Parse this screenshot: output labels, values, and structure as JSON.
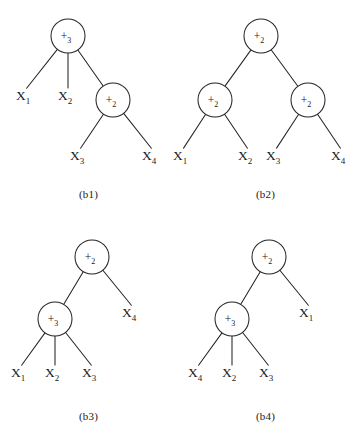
{
  "figure": {
    "type": "expression-tree-diagram",
    "background_color": "#ffffff",
    "stroke_color": "#252525",
    "panel_count": 4
  },
  "panels": [
    {
      "id": "b1",
      "caption": "(b1)",
      "nodes": [
        {
          "id": "n1",
          "op": "+",
          "arity": "3",
          "label": "+3",
          "cx": 68,
          "cy": 36,
          "r": 17
        },
        {
          "id": "n2",
          "op": "+",
          "arity": "2",
          "label": "+2",
          "cx": 113,
          "cy": 100,
          "r": 17
        }
      ],
      "leaves": [
        {
          "id": "l1",
          "var": "X",
          "index": "1",
          "label": "X1",
          "x": 26,
          "y": 100
        },
        {
          "id": "l2",
          "var": "X",
          "index": "2",
          "label": "X2",
          "x": 68,
          "y": 100
        },
        {
          "id": "l3",
          "var": "X",
          "index": "3",
          "label": "X3",
          "x": 80,
          "y": 160
        },
        {
          "id": "l4",
          "var": "X",
          "index": "4",
          "label": "X4",
          "x": 152,
          "y": 160
        }
      ],
      "edges": [
        {
          "from": "n1",
          "to": "l1"
        },
        {
          "from": "n1",
          "to": "l2"
        },
        {
          "from": "n1",
          "to": "n2"
        },
        {
          "from": "n2",
          "to": "l3"
        },
        {
          "from": "n2",
          "to": "l4"
        }
      ]
    },
    {
      "id": "b2",
      "caption": "(b2)",
      "nodes": [
        {
          "id": "n1",
          "op": "+",
          "arity": "2",
          "label": "+2",
          "cx": 84,
          "cy": 36,
          "r": 17
        },
        {
          "id": "n2",
          "op": "+",
          "arity": "2",
          "label": "+2",
          "cx": 38,
          "cy": 100,
          "r": 17
        },
        {
          "id": "n3",
          "op": "+",
          "arity": "2",
          "label": "+2",
          "cx": 131,
          "cy": 100,
          "r": 17
        }
      ],
      "leaves": [
        {
          "id": "l1",
          "var": "X",
          "index": "1",
          "label": "X1",
          "x": 6,
          "y": 160
        },
        {
          "id": "l2",
          "var": "X",
          "index": "2",
          "label": "X2",
          "x": 71,
          "y": 160
        },
        {
          "id": "l3",
          "var": "X",
          "index": "3",
          "label": "X3",
          "x": 99,
          "y": 160
        },
        {
          "id": "l4",
          "var": "X",
          "index": "4",
          "label": "X4",
          "x": 164,
          "y": 160
        }
      ],
      "edges": [
        {
          "from": "n1",
          "to": "n2"
        },
        {
          "from": "n1",
          "to": "n3"
        },
        {
          "from": "n2",
          "to": "l1"
        },
        {
          "from": "n2",
          "to": "l2"
        },
        {
          "from": "n3",
          "to": "l3"
        },
        {
          "from": "n3",
          "to": "l4"
        }
      ]
    },
    {
      "id": "b3",
      "caption": "(b3)",
      "nodes": [
        {
          "id": "n1",
          "op": "+",
          "arity": "2",
          "label": "+2",
          "cx": 92,
          "cy": 38,
          "r": 17
        },
        {
          "id": "n2",
          "op": "+",
          "arity": "3",
          "label": "+3",
          "cx": 55,
          "cy": 100,
          "r": 17
        }
      ],
      "leaves": [
        {
          "id": "l1",
          "var": "X",
          "index": "1",
          "label": "X1",
          "x": 21,
          "y": 158
        },
        {
          "id": "l2",
          "var": "X",
          "index": "2",
          "label": "X2",
          "x": 55,
          "y": 158
        },
        {
          "id": "l3",
          "var": "X",
          "index": "3",
          "label": "X3",
          "x": 92,
          "y": 158
        },
        {
          "id": "l4",
          "var": "X",
          "index": "4",
          "label": "X4",
          "x": 132,
          "y": 98
        }
      ],
      "edges": [
        {
          "from": "n1",
          "to": "n2"
        },
        {
          "from": "n1",
          "to": "l4"
        },
        {
          "from": "n2",
          "to": "l1"
        },
        {
          "from": "n2",
          "to": "l2"
        },
        {
          "from": "n2",
          "to": "l3"
        }
      ]
    },
    {
      "id": "b4",
      "caption": "(b4)",
      "nodes": [
        {
          "id": "n1",
          "op": "+",
          "arity": "2",
          "label": "+2",
          "cx": 92,
          "cy": 38,
          "r": 17
        },
        {
          "id": "n2",
          "op": "+",
          "arity": "3",
          "label": "+3",
          "cx": 55,
          "cy": 100,
          "r": 17
        }
      ],
      "leaves": [
        {
          "id": "l1",
          "var": "X",
          "index": "4",
          "label": "X4",
          "x": 21,
          "y": 158
        },
        {
          "id": "l2",
          "var": "X",
          "index": "2",
          "label": "X2",
          "x": 55,
          "y": 158
        },
        {
          "id": "l3",
          "var": "X",
          "index": "3",
          "label": "X3",
          "x": 92,
          "y": 158
        },
        {
          "id": "l4",
          "var": "X",
          "index": "1",
          "label": "X1",
          "x": 132,
          "y": 98
        }
      ],
      "edges": [
        {
          "from": "n1",
          "to": "n2"
        },
        {
          "from": "n1",
          "to": "l4"
        },
        {
          "from": "n2",
          "to": "l1"
        },
        {
          "from": "n2",
          "to": "l2"
        },
        {
          "from": "n2",
          "to": "l3"
        }
      ]
    }
  ],
  "captions": {
    "b1": "(b1)",
    "b2": "(b2)",
    "b3": "(b3)",
    "b4": "(b4)"
  }
}
